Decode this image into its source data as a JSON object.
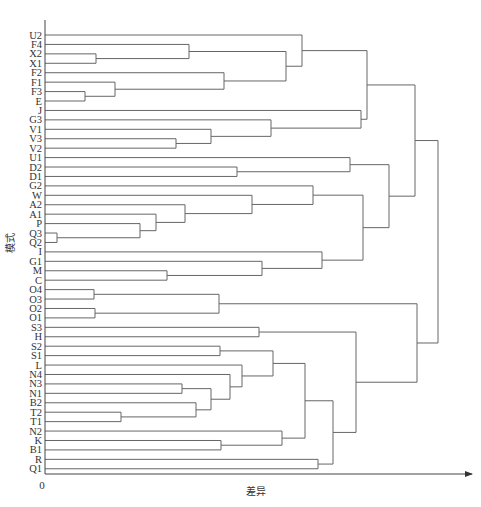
{
  "chart_data": {
    "type": "dendrogram",
    "title": "",
    "xlabel": "差异",
    "ylabel": "模式",
    "origin_label": "0",
    "orientation": "horizontal",
    "leaves": [
      "U2",
      "F4",
      "X2",
      "X1",
      "F2",
      "F1",
      "F3",
      "E",
      "J",
      "G3",
      "V1",
      "V3",
      "V2",
      "U1",
      "D2",
      "D1",
      "G2",
      "W",
      "A2",
      "A1",
      "P",
      "Q3",
      "Q2",
      "I",
      "G1",
      "M",
      "C",
      "O4",
      "O3",
      "O2",
      "O1",
      "S3",
      "H",
      "S2",
      "S1",
      "L",
      "N4",
      "N3",
      "N1",
      "B2",
      "T2",
      "T1",
      "N2",
      "K",
      "B1",
      "R",
      "Q1"
    ],
    "merges_note": "height values are in pixel units of horizontal distance from the y-axis (x=45) in the original figure; no numeric tick labels shown",
    "merges": [
      {
        "id": "m1",
        "children": [
          "X2",
          "X1"
        ],
        "height": 51
      },
      {
        "id": "m2",
        "children": [
          "F3",
          "E"
        ],
        "height": 40
      },
      {
        "id": "m3",
        "children": [
          "F1",
          "m2"
        ],
        "height": 70
      },
      {
        "id": "m4",
        "children": [
          "F4",
          "m1"
        ],
        "height": 144
      },
      {
        "id": "m5",
        "children": [
          "F2",
          "m3"
        ],
        "height": 179
      },
      {
        "id": "m6",
        "children": [
          "m4",
          "m5"
        ],
        "height": 241
      },
      {
        "id": "m7",
        "children": [
          "U2",
          "m6"
        ],
        "height": 257
      },
      {
        "id": "m8",
        "children": [
          "V3",
          "V2"
        ],
        "height": 131
      },
      {
        "id": "m9",
        "children": [
          "V1",
          "m8"
        ],
        "height": 166
      },
      {
        "id": "m10",
        "children": [
          "G3",
          "m9"
        ],
        "height": 226
      },
      {
        "id": "m11",
        "children": [
          "J",
          "m10"
        ],
        "height": 316
      },
      {
        "id": "m12",
        "children": [
          "m7",
          "m11"
        ],
        "height": 322
      },
      {
        "id": "m13",
        "children": [
          "D2",
          "D1"
        ],
        "height": 192
      },
      {
        "id": "m14",
        "children": [
          "U1",
          "m13"
        ],
        "height": 305
      },
      {
        "id": "m15",
        "children": [
          "Q3",
          "Q2"
        ],
        "height": 12
      },
      {
        "id": "m16",
        "children": [
          "P",
          "m15"
        ],
        "height": 95
      },
      {
        "id": "m17",
        "children": [
          "A1",
          "m16"
        ],
        "height": 111
      },
      {
        "id": "m18",
        "children": [
          "A2",
          "m17"
        ],
        "height": 140
      },
      {
        "id": "m19",
        "children": [
          "W",
          "m18"
        ],
        "height": 207
      },
      {
        "id": "m20",
        "children": [
          "G2",
          "m19"
        ],
        "height": 268
      },
      {
        "id": "m21",
        "children": [
          "M",
          "C"
        ],
        "height": 122
      },
      {
        "id": "m22",
        "children": [
          "G1",
          "m21"
        ],
        "height": 217
      },
      {
        "id": "m23",
        "children": [
          "I",
          "m22"
        ],
        "height": 277
      },
      {
        "id": "m24",
        "children": [
          "m20",
          "m23"
        ],
        "height": 318
      },
      {
        "id": "m25",
        "children": [
          "m14",
          "m24"
        ],
        "height": 344
      },
      {
        "id": "m26",
        "children": [
          "m12",
          "m25"
        ],
        "height": 370
      },
      {
        "id": "m27",
        "children": [
          "O4",
          "O3"
        ],
        "height": 49
      },
      {
        "id": "m28",
        "children": [
          "O2",
          "O1"
        ],
        "height": 50
      },
      {
        "id": "m29",
        "children": [
          "m27",
          "m28"
        ],
        "height": 174
      },
      {
        "id": "m30",
        "children": [
          "S3",
          "H"
        ],
        "height": 214
      },
      {
        "id": "m31",
        "children": [
          "S2",
          "S1"
        ],
        "height": 175
      },
      {
        "id": "m32",
        "children": [
          "T2",
          "T1"
        ],
        "height": 76
      },
      {
        "id": "m33",
        "children": [
          "N3",
          "N1"
        ],
        "height": 137
      },
      {
        "id": "m34",
        "children": [
          "B2",
          "m32"
        ],
        "height": 151
      },
      {
        "id": "m35",
        "children": [
          "m33",
          "m34"
        ],
        "height": 166
      },
      {
        "id": "m36",
        "children": [
          "N4",
          "m35"
        ],
        "height": 185
      },
      {
        "id": "m37",
        "children": [
          "L",
          "m36"
        ],
        "height": 197
      },
      {
        "id": "m38",
        "children": [
          "m31",
          "m37"
        ],
        "height": 228
      },
      {
        "id": "m39",
        "children": [
          "K",
          "B1"
        ],
        "height": 176
      },
      {
        "id": "m40",
        "children": [
          "N2",
          "m39"
        ],
        "height": 237
      },
      {
        "id": "m41",
        "children": [
          "m38",
          "m40"
        ],
        "height": 260
      },
      {
        "id": "m42",
        "children": [
          "R",
          "Q1"
        ],
        "height": 273
      },
      {
        "id": "m43",
        "children": [
          "m41",
          "m42"
        ],
        "height": 288
      },
      {
        "id": "m44",
        "children": [
          "m30",
          "m43"
        ],
        "height": 311
      },
      {
        "id": "m45",
        "children": [
          "m29",
          "m44"
        ],
        "height": 372
      },
      {
        "id": "root",
        "children": [
          "m26",
          "m45"
        ],
        "height": 393
      }
    ],
    "layout": {
      "axis_x": 45,
      "axis_top": 20,
      "axis_bottom_y": 474,
      "axis_right_x": 472,
      "first_leaf_y": 35,
      "leaf_spacing": 9.43
    }
  },
  "labels": {
    "xlabel": "差异",
    "ylabel": "模式",
    "origin": "0"
  }
}
